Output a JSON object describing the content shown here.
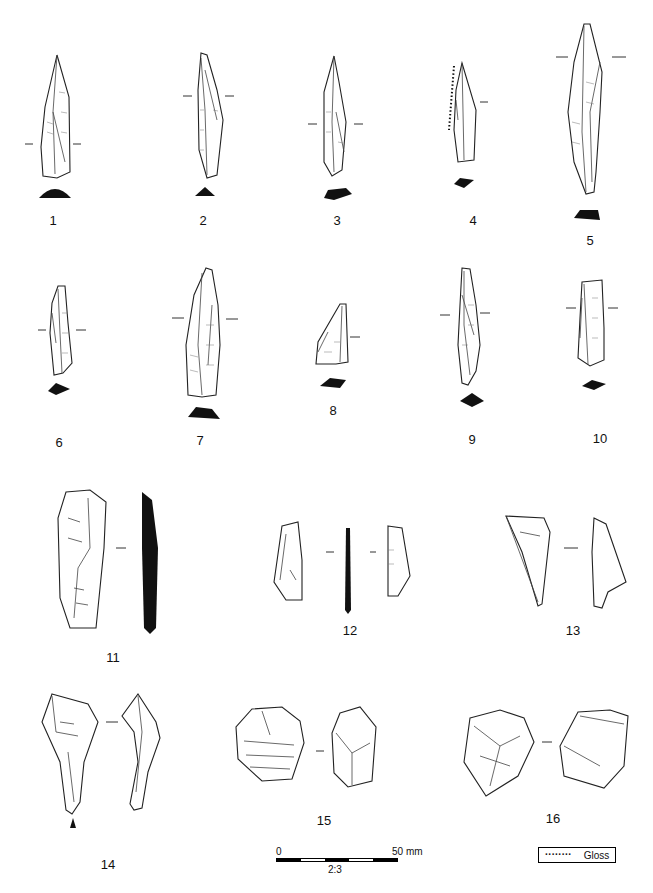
{
  "plate": {
    "artifacts": [
      {
        "number": "1"
      },
      {
        "number": "2"
      },
      {
        "number": "3"
      },
      {
        "number": "4"
      },
      {
        "number": "5"
      },
      {
        "number": "6"
      },
      {
        "number": "7"
      },
      {
        "number": "8"
      },
      {
        "number": "9"
      },
      {
        "number": "10"
      },
      {
        "number": "11"
      },
      {
        "number": "12"
      },
      {
        "number": "13"
      },
      {
        "number": "14"
      },
      {
        "number": "15"
      },
      {
        "number": "16"
      }
    ],
    "scale_bar": {
      "start_label": "0",
      "end_label": "50 mm",
      "ratio": "2:3",
      "segments": 5
    },
    "legend": {
      "symbol": "········",
      "label": "Gloss"
    }
  }
}
